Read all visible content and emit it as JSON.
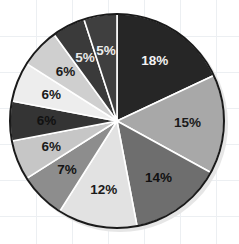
{
  "chart_data": {
    "type": "pie",
    "title": "",
    "subtitle": "",
    "xlabel": "",
    "ylabel": "",
    "legend": "none",
    "grid": true,
    "start_angle_deg": 0,
    "direction": "clockwise",
    "units": "percent",
    "total": 100,
    "categories": [
      "Segment 1",
      "Segment 2",
      "Segment 3",
      "Segment 4",
      "Segment 5",
      "Segment 6",
      "Segment 7",
      "Segment 8",
      "Segment 9",
      "Segment 10",
      "Segment 11"
    ],
    "values": [
      18,
      15,
      14,
      12,
      7,
      6,
      6,
      6,
      6,
      5,
      5
    ],
    "labels": [
      "18%",
      "15%",
      "14%",
      "12%",
      "7%",
      "6%",
      "6%",
      "6%",
      "6%",
      "5%",
      "5%"
    ],
    "slices": [
      {
        "label": "18%",
        "value": 18,
        "fill": "#262626",
        "text_color": "#f2f2f2"
      },
      {
        "label": "15%",
        "value": 15,
        "fill": "#a8a8a8",
        "text_color": "#1a1a1a"
      },
      {
        "label": "14%",
        "value": 14,
        "fill": "#6e6e6e",
        "text_color": "#111111"
      },
      {
        "label": "12%",
        "value": 12,
        "fill": "#e2e2e2",
        "text_color": "#1a1a1a"
      },
      {
        "label": "7%",
        "value": 7,
        "fill": "#8d8d8d",
        "text_color": "#141414"
      },
      {
        "label": "6%",
        "value": 6,
        "fill": "#c6c6c6",
        "text_color": "#1a1a1a"
      },
      {
        "label": "6%",
        "value": 6,
        "fill": "#343434",
        "text_color": "#111111"
      },
      {
        "label": "6%",
        "value": 6,
        "fill": "#ededed",
        "text_color": "#1a1a1a"
      },
      {
        "label": "6%",
        "value": 6,
        "fill": "#cfcfcf",
        "text_color": "#1a1a1a"
      },
      {
        "label": "5%",
        "value": 5,
        "fill": "#3a3a3a",
        "text_color": "#e8e8e8"
      },
      {
        "label": "5%",
        "value": 5,
        "fill": "#3f3f3f",
        "text_color": "#ededed"
      }
    ],
    "geometry": {
      "center_x": 117,
      "center_y": 121,
      "radius": 107,
      "label_radius_ratio": 0.66
    },
    "style": {
      "background": "#ffffff",
      "grid_color": "#eceff2",
      "grid_spacing": 36,
      "divider_color": "#ffffff",
      "outline_color": "#1a1a1a",
      "shadow_color": "#e6e6e6"
    }
  }
}
